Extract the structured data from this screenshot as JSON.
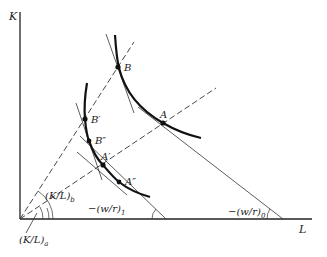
{
  "axes": {
    "y_label": "K",
    "x_label": "L"
  },
  "points": {
    "A": "A",
    "B": "B",
    "A_prime": "A′",
    "B_prime": "B′",
    "A_double_prime": "A″",
    "B_double_prime": "B″"
  },
  "rays": {
    "ray_a_label_main": "(K/L)",
    "ray_a_label_sub": "a",
    "ray_b_label_main": "(K/L)",
    "ray_b_label_sub": "b"
  },
  "isocost": {
    "slope0_label_main": "−(w/r)",
    "slope0_label_sub": "0",
    "slope1_label_main": "−(w/r)",
    "slope1_label_sub": "1"
  },
  "colors": {
    "ink": "#111111",
    "background": "#ffffff"
  }
}
